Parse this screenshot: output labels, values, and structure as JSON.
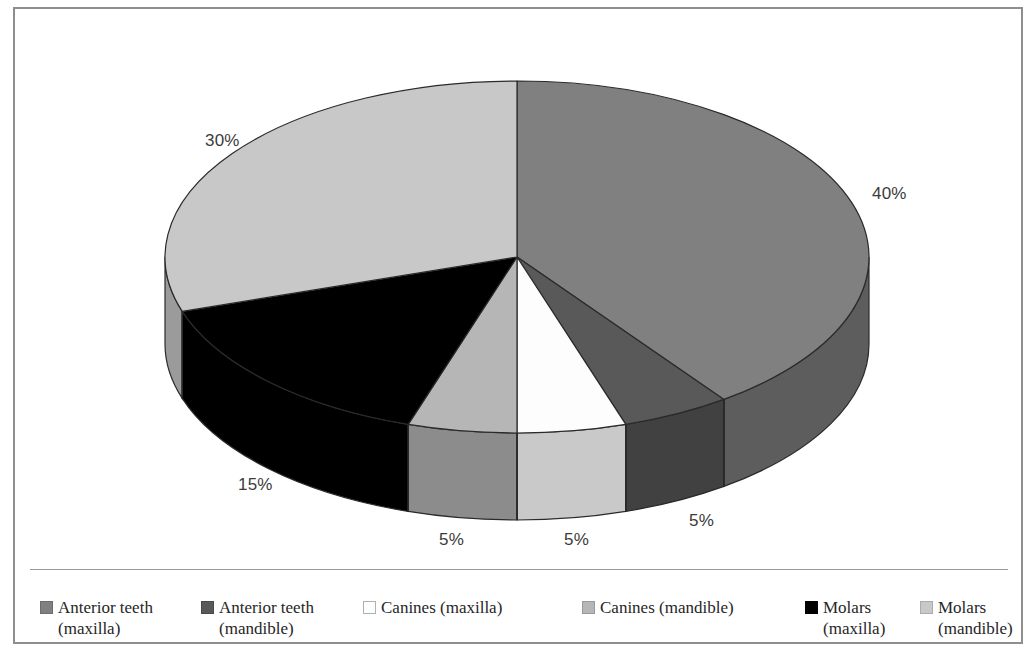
{
  "figure": {
    "background_color": "#ffffff",
    "frame_color": "#8e8e8e"
  },
  "chart_data": {
    "type": "pie",
    "title": "",
    "xlabel": "",
    "ylabel": "",
    "three_d": true,
    "start_angle_deg": 0,
    "direction": "clockwise",
    "legend_position": "bottom",
    "grid": false,
    "categories": [
      "Anterior teeth (maxilla)",
      "Anterior teeth (mandible)",
      "Canines (maxilla)",
      "Canines (mandible)",
      "Molars (maxilla)",
      "Molars (mandible)"
    ],
    "values": [
      40,
      5,
      5,
      5,
      15,
      30
    ],
    "labels": [
      "40%",
      "5%",
      "5%",
      "5%",
      "15%",
      "30%"
    ],
    "colors": [
      "#808080",
      "#595959",
      "#fdfdfd",
      "#b6b6b6",
      "#000000",
      "#c8c8c8"
    ],
    "side_colors": [
      "#5d5d5d",
      "#414141",
      "#c9c9c9",
      "#8c8c8c",
      "#000000",
      "#9b9b9b"
    ],
    "slice_outline_color": "#2a2a2a"
  },
  "slice_labels": [
    {
      "text": "40%",
      "left": 857,
      "top": 175
    },
    {
      "text": "5%",
      "left": 674,
      "top": 502
    },
    {
      "text": "5%",
      "left": 549,
      "top": 521
    },
    {
      "text": "5%",
      "left": 424,
      "top": 521
    },
    {
      "text": "15%",
      "left": 223,
      "top": 466
    },
    {
      "text": "30%",
      "left": 190,
      "top": 122
    }
  ],
  "legend": {
    "items": [
      {
        "name": "legend-anterior-teeth-maxilla",
        "label": "Anterior teeth\n(maxilla)",
        "color": "#808080",
        "border": "#6d6d6d",
        "left": 25
      },
      {
        "name": "legend-anterior-teeth-mandible",
        "label": "Anterior teeth\n(mandible)",
        "color": "#595959",
        "border": "#4a4a4a",
        "left": 186
      },
      {
        "name": "legend-canines-maxilla",
        "label": "Canines (maxilla)",
        "color": "#fdfdfd",
        "border": "#b0b0b0",
        "left": 348
      },
      {
        "name": "legend-canines-mandible",
        "label": "Canines (mandible)",
        "color": "#b6b6b6",
        "border": "#9a9a9a",
        "left": 567
      },
      {
        "name": "legend-molars-maxilla",
        "label": "Molars\n(maxilla)",
        "color": "#000000",
        "border": "#000000",
        "left": 790
      },
      {
        "name": "legend-molars-mandible",
        "label": "Molars\n(mandible)",
        "color": "#c8c8c8",
        "border": "#ababab",
        "left": 905
      }
    ]
  }
}
